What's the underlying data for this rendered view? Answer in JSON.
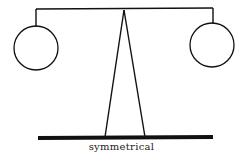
{
  "diagram": {
    "caption": "symmetrical",
    "colors": {
      "stroke": "#111111",
      "background": "#ffffff"
    },
    "elements": {
      "beam": {
        "x1": 36,
        "y1": 9,
        "x2": 213,
        "y2": 9
      },
      "left_hanger": {
        "x": 36,
        "y1": 9,
        "y2": 27
      },
      "right_hanger": {
        "x": 213,
        "y1": 9,
        "y2": 24
      },
      "left_weight": {
        "cx": 36,
        "cy": 48,
        "r": 22
      },
      "right_weight": {
        "cx": 212,
        "cy": 45,
        "r": 22
      },
      "fulcrum": {
        "apex": [
          124,
          10
        ],
        "left_foot": [
          105,
          137
        ],
        "right_foot": [
          145,
          137
        ]
      },
      "base": {
        "x1": 38,
        "x2": 213,
        "y": 138,
        "thickness": 4
      }
    }
  }
}
